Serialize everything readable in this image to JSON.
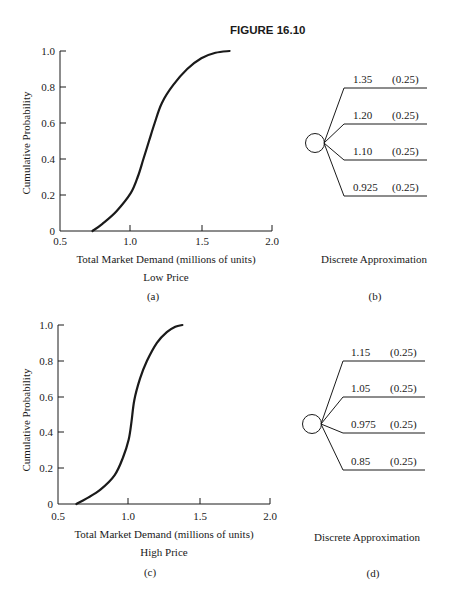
{
  "figure": {
    "title": "FIGURE 16.10"
  },
  "colors": {
    "ink": "#1a1a1a",
    "background": "#ffffff"
  },
  "panels": {
    "a": {
      "label": "(a)",
      "ylabel": "Cumulative Probability",
      "xlabel": "Total Market Demand (millions of units)",
      "subtitle": "Low Price",
      "xticks": [
        "0.5",
        "1.0",
        "1.5",
        "2.0"
      ],
      "yticks": [
        "0",
        "0.2",
        "0.4",
        "0.6",
        "0.8",
        "1.0"
      ]
    },
    "b": {
      "label": "(b)",
      "caption": "Discrete Approximation",
      "branches": [
        {
          "value": "1.35",
          "prob": "(0.25)"
        },
        {
          "value": "1.20",
          "prob": "(0.25)"
        },
        {
          "value": "1.10",
          "prob": "(0.25)"
        },
        {
          "value": "0.925",
          "prob": "(0.25)"
        }
      ]
    },
    "c": {
      "label": "(c)",
      "ylabel": "Cumulative Probability",
      "xlabel": "Total Market Demand (millions of units)",
      "subtitle": "High Price",
      "xticks": [
        "0.5",
        "1.0",
        "1.5",
        "2.0"
      ],
      "yticks": [
        "0",
        "0.2",
        "0.4",
        "0.6",
        "0.8",
        "1.0"
      ]
    },
    "d": {
      "label": "(d)",
      "caption": "Discrete Approximation",
      "branches": [
        {
          "value": "1.15",
          "prob": "(0.25)"
        },
        {
          "value": "1.05",
          "prob": "(0.25)"
        },
        {
          "value": "0.975",
          "prob": "(0.25)"
        },
        {
          "value": "0.85",
          "prob": "(0.25)"
        }
      ]
    }
  },
  "chart_data": [
    {
      "type": "line",
      "title": "Low Price",
      "xlabel": "Total Market Demand (millions of units)",
      "ylabel": "Cumulative Probability",
      "xlim": [
        0.5,
        2.0
      ],
      "ylim": [
        0,
        1.0
      ],
      "xticks": [
        0.5,
        1.0,
        1.5,
        2.0
      ],
      "yticks": [
        0,
        0.2,
        0.4,
        0.6,
        0.8,
        1.0
      ],
      "grid": false,
      "series": [
        {
          "name": "Cumulative probability (low price)",
          "x": [
            0.73,
            0.8,
            0.9,
            1.0,
            1.05,
            1.09,
            1.13,
            1.17,
            1.22,
            1.3,
            1.4,
            1.5,
            1.6,
            1.7
          ],
          "y": [
            0.0,
            0.04,
            0.11,
            0.21,
            0.3,
            0.4,
            0.5,
            0.6,
            0.71,
            0.81,
            0.9,
            0.96,
            0.99,
            1.0
          ]
        }
      ]
    },
    {
      "type": "tree",
      "title": "Discrete Approximation (Low Price)",
      "categories": [
        "1.35",
        "1.20",
        "1.10",
        "0.925"
      ],
      "values": [
        0.25,
        0.25,
        0.25,
        0.25
      ]
    },
    {
      "type": "line",
      "title": "High Price",
      "xlabel": "Total Market Demand (millions of units)",
      "ylabel": "Cumulative Probability",
      "xlim": [
        0.5,
        2.0
      ],
      "ylim": [
        0,
        1.0
      ],
      "xticks": [
        0.5,
        1.0,
        1.5,
        2.0
      ],
      "yticks": [
        0,
        0.2,
        0.4,
        0.6,
        0.8,
        1.0
      ],
      "grid": false,
      "series": [
        {
          "name": "Cumulative probability (high price)",
          "x": [
            0.63,
            0.7,
            0.8,
            0.9,
            0.96,
            1.0,
            1.02,
            1.04,
            1.08,
            1.13,
            1.2,
            1.27,
            1.33,
            1.38
          ],
          "y": [
            0.0,
            0.03,
            0.08,
            0.16,
            0.26,
            0.36,
            0.46,
            0.58,
            0.7,
            0.8,
            0.9,
            0.96,
            0.99,
            1.0
          ]
        }
      ]
    },
    {
      "type": "tree",
      "title": "Discrete Approximation (High Price)",
      "categories": [
        "1.15",
        "1.05",
        "0.975",
        "0.85"
      ],
      "values": [
        0.25,
        0.25,
        0.25,
        0.25
      ]
    }
  ]
}
